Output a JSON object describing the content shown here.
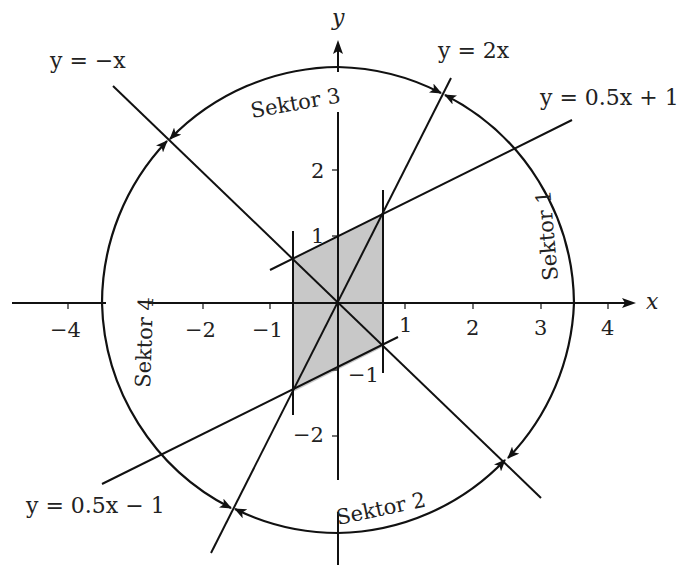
{
  "axes": {
    "x_label": "x",
    "y_label": "y",
    "x_ticks": [
      {
        "value": -4,
        "label": "−4"
      },
      {
        "value": -2,
        "label": "−2"
      },
      {
        "value": -1,
        "label": "−1"
      },
      {
        "value": 1,
        "label": "1"
      },
      {
        "value": 2,
        "label": "2"
      },
      {
        "value": 3,
        "label": "3"
      },
      {
        "value": 4,
        "label": "4"
      }
    ],
    "y_ticks": [
      {
        "value": 2,
        "label": "2"
      },
      {
        "value": 1,
        "label": "1"
      },
      {
        "value": -1,
        "label": "−1"
      },
      {
        "value": -2,
        "label": "−2"
      }
    ]
  },
  "lines": [
    {
      "id": "neg-x",
      "equation": "y = −x",
      "slope": -1,
      "intercept": 0
    },
    {
      "id": "two-x",
      "equation": "y = 2x",
      "slope": 2,
      "intercept": 0
    },
    {
      "id": "half-x-plus-1",
      "equation": "y = 0.5x + 1",
      "slope": 0.5,
      "intercept": 1
    },
    {
      "id": "half-x-minus-1",
      "equation": "y = 0.5x − 1",
      "slope": 0.5,
      "intercept": -1
    }
  ],
  "vertical_lines": [
    {
      "x": -0.667
    },
    {
      "x": 0.667
    }
  ],
  "shaded_region": {
    "description": "Parallelogram bounded by x = ±2/3, y = 0.5x + 1 and y = 0.5x − 1",
    "vertices": [
      [
        -0.667,
        0.667
      ],
      [
        0.667,
        1.333
      ],
      [
        0.667,
        -0.667
      ],
      [
        -0.667,
        -1.333
      ]
    ],
    "fill": "#c8c8c8"
  },
  "circle": {
    "center": [
      0,
      0
    ],
    "radius": 3.5
  },
  "sectors": [
    {
      "label": "Sektor 1"
    },
    {
      "label": "Sektor 2"
    },
    {
      "label": "Sektor 3"
    },
    {
      "label": "Sektor 4"
    }
  ]
}
